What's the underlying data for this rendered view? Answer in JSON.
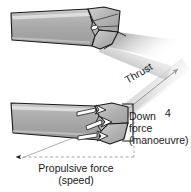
{
  "figure": {
    "number": "4",
    "background_color": "#ffffff"
  },
  "labels": {
    "thrust": "Thrust",
    "down_force_line1": "Down",
    "down_force_line2": "force",
    "down_force_line3": "(manoeuvre)",
    "propulsive_line1": "Propulsive force",
    "propulsive_line2": "(speed)"
  },
  "colors": {
    "body_fill": "#a8a8a8",
    "body_fill_light": "#c4c4c4",
    "highlight_stripe": "#d6d6d6",
    "fin_fill": "#b4b4b4",
    "outline": "#1a1a1a",
    "text": "#1a1a1a",
    "wake_gradient_start": "#8c8c8c",
    "wake_gradient_end": "#ffffff",
    "dashed_guide": "#9a9a9a",
    "bracket": "#1a1a1a"
  },
  "panels": [
    {
      "name": "upper-view",
      "description": "Fish tail peduncle and caudal fin seen from above with wake trailing to the right",
      "has_wake": true,
      "has_force_arrows": false
    },
    {
      "name": "lower-view",
      "description": "Fish tail peduncle and caudal fin angled, with thrust, down force and propulsive force vectors",
      "has_wake": true,
      "has_force_arrows": true
    }
  ],
  "vectors": [
    {
      "name": "thrust",
      "label": "Thrust",
      "direction": "up-right",
      "style": "diagonal-line-with-arrowhead"
    },
    {
      "name": "down-force",
      "label": "Down force (manoeuvre)",
      "direction": "down",
      "style": "vertical-bracket"
    },
    {
      "name": "propulsive-force",
      "label": "Propulsive force (speed)",
      "direction": "left",
      "style": "horizontal-dashed-with-arrowhead"
    }
  ]
}
